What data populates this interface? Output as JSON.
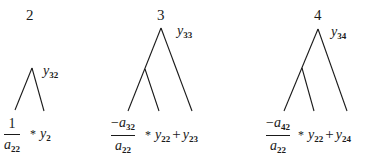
{
  "diagram": {
    "trees": [
      {
        "label": "2",
        "root_var": {
          "base": "y",
          "sub": "32"
        },
        "fraction": {
          "numerator": "1",
          "denominator": {
            "base": "a",
            "sub": "22"
          }
        },
        "operator": "*",
        "terms": [
          {
            "base": "y",
            "sub": "2"
          }
        ]
      },
      {
        "label": "3",
        "root_var": {
          "base": "y",
          "sub": "33"
        },
        "fraction": {
          "numerator_sign": "−",
          "numerator": {
            "base": "a",
            "sub": "32"
          },
          "denominator": {
            "base": "a",
            "sub": "22"
          }
        },
        "operator": "*",
        "terms": [
          {
            "base": "y",
            "sub": "22"
          },
          {
            "base": "y",
            "sub": "23"
          }
        ],
        "joiner": "+"
      },
      {
        "label": "4",
        "root_var": {
          "base": "y",
          "sub": "34"
        },
        "fraction": {
          "numerator_sign": "−",
          "numerator": {
            "base": "a",
            "sub": "42"
          },
          "denominator": {
            "base": "a",
            "sub": "22"
          }
        },
        "operator": "*",
        "terms": [
          {
            "base": "y",
            "sub": "22"
          },
          {
            "base": "y",
            "sub": "24"
          }
        ],
        "joiner": "+"
      }
    ],
    "line_color": "#1a1a1a"
  }
}
